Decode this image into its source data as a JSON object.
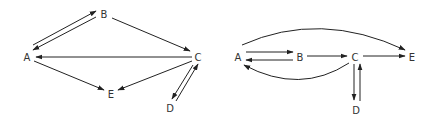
{
  "diagrams": [
    {
      "id": "left",
      "nodes": [
        {
          "id": "A",
          "label": "A"
        },
        {
          "id": "B",
          "label": "B"
        },
        {
          "id": "C",
          "label": "C"
        },
        {
          "id": "D",
          "label": "D"
        },
        {
          "id": "E",
          "label": "E"
        }
      ],
      "edges": [
        {
          "from": "A",
          "to": "B"
        },
        {
          "from": "B",
          "to": "A"
        },
        {
          "from": "B",
          "to": "C"
        },
        {
          "from": "C",
          "to": "A"
        },
        {
          "from": "A",
          "to": "E"
        },
        {
          "from": "C",
          "to": "E"
        },
        {
          "from": "C",
          "to": "D"
        },
        {
          "from": "D",
          "to": "C"
        }
      ]
    },
    {
      "id": "right",
      "nodes": [
        {
          "id": "A",
          "label": "A"
        },
        {
          "id": "B",
          "label": "B"
        },
        {
          "id": "C",
          "label": "C"
        },
        {
          "id": "D",
          "label": "D"
        },
        {
          "id": "E",
          "label": "E"
        }
      ],
      "edges": [
        {
          "from": "A",
          "to": "B"
        },
        {
          "from": "B",
          "to": "A"
        },
        {
          "from": "B",
          "to": "C"
        },
        {
          "from": "C",
          "to": "E"
        },
        {
          "from": "A",
          "to": "E",
          "style": "arc-over"
        },
        {
          "from": "C",
          "to": "A",
          "style": "arc-under"
        },
        {
          "from": "C",
          "to": "D"
        },
        {
          "from": "D",
          "to": "C"
        }
      ]
    }
  ],
  "colors": {
    "stroke": "#222222",
    "label": "#333333"
  }
}
